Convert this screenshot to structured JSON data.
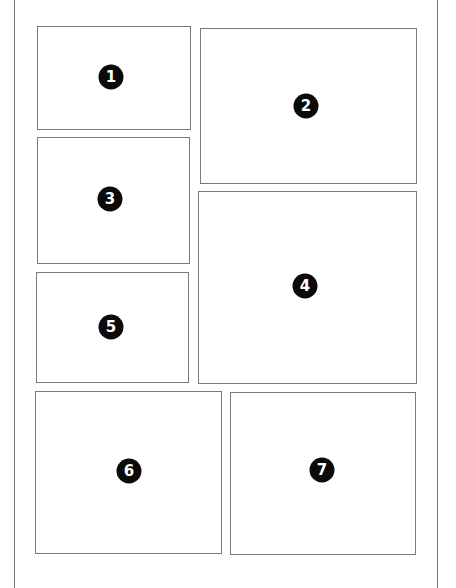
{
  "diagram": {
    "type": "comic page panel layout",
    "panels": [
      {
        "number": "1",
        "label": "Panel 1"
      },
      {
        "number": "2",
        "label": "Panel 2"
      },
      {
        "number": "3",
        "label": "Panel 3"
      },
      {
        "number": "4",
        "label": "Panel 4"
      },
      {
        "number": "5",
        "label": "Panel 5"
      },
      {
        "number": "6",
        "label": "Panel 6"
      },
      {
        "number": "7",
        "label": "Panel 7"
      }
    ]
  },
  "colors": {
    "border": "#7a7a7a",
    "badge": "#0a0a0a",
    "badge_text": "#ffffff",
    "background": "#ffffff"
  }
}
